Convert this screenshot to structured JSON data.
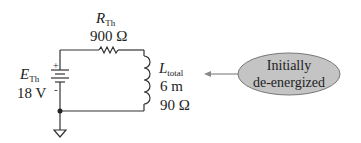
{
  "circuit": {
    "source": {
      "symbol": "E",
      "subscript": "Th",
      "value": "18 V",
      "plus": "+",
      "minus": "-"
    },
    "resistor": {
      "symbol": "R",
      "subscript": "Th",
      "value": "900 Ω"
    },
    "inductor": {
      "symbol": "L",
      "subscript": "total",
      "inductance": "6 m",
      "resistance": "90 Ω"
    }
  },
  "callout": {
    "line1": "Initially",
    "line2": "de-energized",
    "fill_color": "#c4c4c4"
  }
}
